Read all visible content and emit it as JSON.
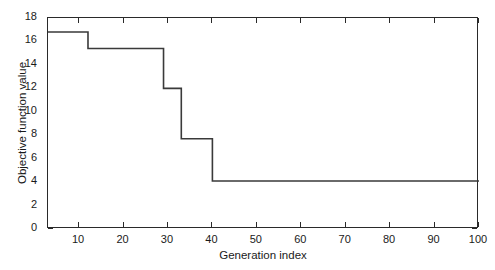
{
  "chart_data": {
    "type": "line",
    "title": "",
    "xlabel": "Generation index",
    "ylabel": "Objective function value",
    "xlim": [
      3,
      100
    ],
    "ylim": [
      0,
      18
    ],
    "xticks": [
      10,
      20,
      30,
      40,
      50,
      60,
      70,
      80,
      90,
      100
    ],
    "xtick_labels": [
      "10",
      "20",
      "30",
      "40",
      "50",
      "60",
      "70",
      "80",
      "90",
      "100"
    ],
    "yticks": [
      0,
      2,
      4,
      6,
      8,
      10,
      12,
      14,
      16,
      18
    ],
    "ytick_labels": [
      "0",
      "2",
      "4",
      "6",
      "8",
      "10",
      "12",
      "14",
      "16",
      "18"
    ],
    "grid": false,
    "legend": null,
    "line_color": "#3a3a3a",
    "line_width": 1.6,
    "drawstyle": "steps-post",
    "series": [
      {
        "name": "best objective",
        "x": [
          3,
          12,
          12,
          29,
          29,
          33,
          33,
          40,
          40,
          100
        ],
        "y": [
          16.8,
          16.8,
          15.4,
          15.4,
          12.0,
          12.0,
          7.7,
          7.7,
          4.1,
          4.1
        ],
        "steps": [
          {
            "from_generation": 3,
            "to_generation": 12,
            "value": 16.8
          },
          {
            "from_generation": 12,
            "to_generation": 29,
            "value": 15.4
          },
          {
            "from_generation": 29,
            "to_generation": 33,
            "value": 12.0
          },
          {
            "from_generation": 33,
            "to_generation": 40,
            "value": 7.7
          },
          {
            "from_generation": 40,
            "to_generation": 100,
            "value": 4.1
          }
        ]
      }
    ]
  }
}
